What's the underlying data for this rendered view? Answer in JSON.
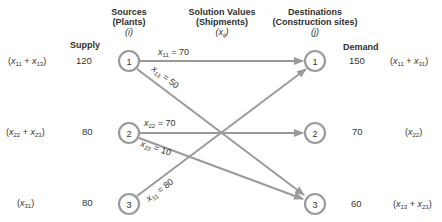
{
  "headers": {
    "sources": [
      "Sources",
      "(Plants)",
      "(i)"
    ],
    "solution": [
      "Solution Values",
      "(Shipments)",
      "(x",
      "ij",
      ")"
    ],
    "destinations": [
      "Destinations",
      "(Construction sites)",
      "(j)"
    ],
    "supply": "Supply",
    "demand": "Demand"
  },
  "sources": [
    {
      "id": "1",
      "supply": "120",
      "expr": [
        {
          "v": "x",
          "s": "11"
        },
        {
          "v": "x",
          "s": "13"
        }
      ]
    },
    {
      "id": "2",
      "supply": "80",
      "expr": [
        {
          "v": "x",
          "s": "22"
        },
        {
          "v": "x",
          "s": "23"
        }
      ]
    },
    {
      "id": "3",
      "supply": "80",
      "expr": [
        {
          "v": "x",
          "s": "31"
        }
      ]
    }
  ],
  "destinations": [
    {
      "id": "1",
      "demand": "150",
      "expr": [
        {
          "v": "x",
          "s": "11"
        },
        {
          "v": "x",
          "s": "31"
        }
      ]
    },
    {
      "id": "2",
      "demand": "70",
      "expr": [
        {
          "v": "x",
          "s": "22"
        }
      ]
    },
    {
      "id": "3",
      "demand": "60",
      "expr": [
        {
          "v": "x",
          "s": "13"
        },
        {
          "v": "x",
          "s": "23"
        }
      ]
    }
  ],
  "edges": [
    {
      "from": "1",
      "to": "1",
      "var": "x",
      "sub": "11",
      "value": "70"
    },
    {
      "from": "1",
      "to": "3",
      "var": "x",
      "sub": "13",
      "value": "50"
    },
    {
      "from": "2",
      "to": "2",
      "var": "x",
      "sub": "22",
      "value": "70"
    },
    {
      "from": "2",
      "to": "3",
      "var": "x",
      "sub": "23",
      "value": "10"
    },
    {
      "from": "3",
      "to": "1",
      "var": "x",
      "sub": "31",
      "value": "80"
    }
  ],
  "colors": {
    "line": "#9a9a9a",
    "text": "#333333"
  }
}
